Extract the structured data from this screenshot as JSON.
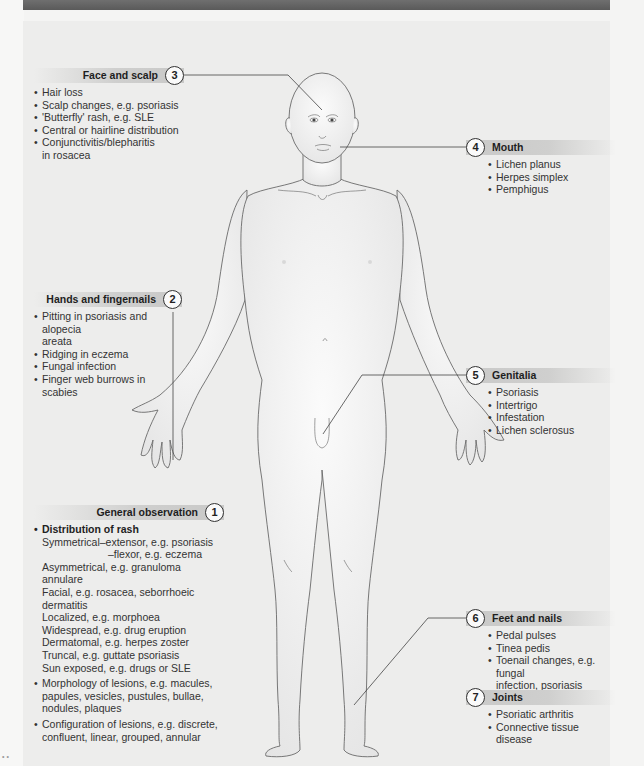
{
  "figure": {
    "colors": {
      "banner": "#5f5f5f",
      "header_band": "#cfcfce",
      "background": "#ededec",
      "text": "#2a2a2a",
      "skin_fill": "#f3f3f3",
      "outline": "#6a6a6a"
    }
  },
  "sections": {
    "face": {
      "number": "3",
      "title": "Face and scalp",
      "items": [
        "Hair loss",
        "Scalp changes, e.g. psoriasis",
        "'Butterfly' rash, e.g. SLE",
        "Central or hairline distribution",
        "Conjunctivitis/blepharitis",
        "in rosacea"
      ]
    },
    "mouth": {
      "number": "4",
      "title": "Mouth",
      "items": [
        "Lichen planus",
        "Herpes simplex",
        "Pemphigus"
      ]
    },
    "hands": {
      "number": "2",
      "title": "Hands and fingernails",
      "items": [
        "Pitting in psoriasis and alopecia",
        "areata",
        "Ridging in eczema",
        "Fungal infection",
        "Finger web burrows in scabies"
      ]
    },
    "genitalia": {
      "number": "5",
      "title": "Genitalia",
      "items": [
        "Psoriasis",
        "Intertrigo",
        "Infestation",
        "Lichen sclerosus"
      ]
    },
    "general": {
      "number": "1",
      "title": "General observation",
      "distribution_heading": "Distribution of rash",
      "distribution": [
        "Symmetrical–extensor, e.g. psoriasis",
        "–flexor, e.g. eczema",
        "Asymmetrical, e.g. granuloma annulare",
        "Facial, e.g. rosacea, seborrhoeic",
        "dermatitis",
        "Localized, e.g. morphoea",
        "Widespread, e.g. drug eruption",
        "Dermatomal, e.g. herpes zoster",
        "Truncal, e.g. guttate psoriasis",
        "Sun exposed, e.g. drugs or SLE"
      ],
      "morphology": [
        "Morphology of lesions, e.g. macules,",
        "papules, vesicles, pustules, bullae,",
        "nodules, plaques"
      ],
      "configuration": [
        "Configuration of lesions, e.g. discrete,",
        "confluent, linear, grouped, annular"
      ]
    },
    "feet": {
      "number": "6",
      "title": "Feet and nails",
      "items": [
        "Pedal pulses",
        "Tinea pedis",
        "Toenail changes, e.g. fungal",
        "infection, psoriasis"
      ]
    },
    "joints": {
      "number": "7",
      "title": "Joints",
      "items": [
        "Psoriatic arthritis",
        "Connective tissue disease"
      ]
    }
  },
  "corner_mark": "• •"
}
